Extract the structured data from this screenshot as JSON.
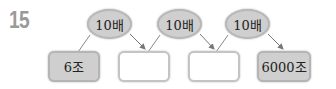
{
  "problem_number": "15",
  "multipliers": [
    {
      "label": "10배"
    },
    {
      "label": "10배"
    },
    {
      "label": "10배"
    }
  ],
  "boxes": [
    {
      "value": "6조",
      "filled": true
    },
    {
      "value": "",
      "filled": false
    },
    {
      "value": "",
      "filled": false
    },
    {
      "value": "6000조",
      "filled": true
    }
  ]
}
